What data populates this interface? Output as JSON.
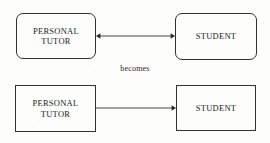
{
  "diagram": {
    "caption": {
      "text": "becomes",
      "x": 100,
      "y": 64,
      "width": 70
    },
    "stroke_color": "#33312f",
    "text_color": "#201e1d",
    "background_color": "#fdfdfc",
    "rows": [
      {
        "id": "before",
        "shape": "rounded",
        "nodes": [
          {
            "id": "personal-tutor-rounded",
            "label": "PERSONAL\nTUTOR",
            "x": 16,
            "y": 13,
            "width": 80,
            "height": 46
          },
          {
            "id": "student-rounded",
            "label": "STUDENT",
            "x": 175,
            "y": 13,
            "width": 82,
            "height": 47
          }
        ],
        "connector": {
          "id": "bidirectional-arrow",
          "direction": "both",
          "x": 96,
          "y": 30,
          "length": 79
        }
      },
      {
        "id": "after",
        "shape": "square",
        "nodes": [
          {
            "id": "personal-tutor-square",
            "label": "PERSONAL\nTUTOR",
            "x": 15,
            "y": 85,
            "width": 81,
            "height": 47
          },
          {
            "id": "student-square",
            "label": "STUDENT",
            "x": 176,
            "y": 85,
            "width": 80,
            "height": 46
          }
        ],
        "connector": {
          "id": "unidirectional-arrow",
          "direction": "right",
          "x": 96,
          "y": 102,
          "length": 80
        }
      }
    ]
  }
}
